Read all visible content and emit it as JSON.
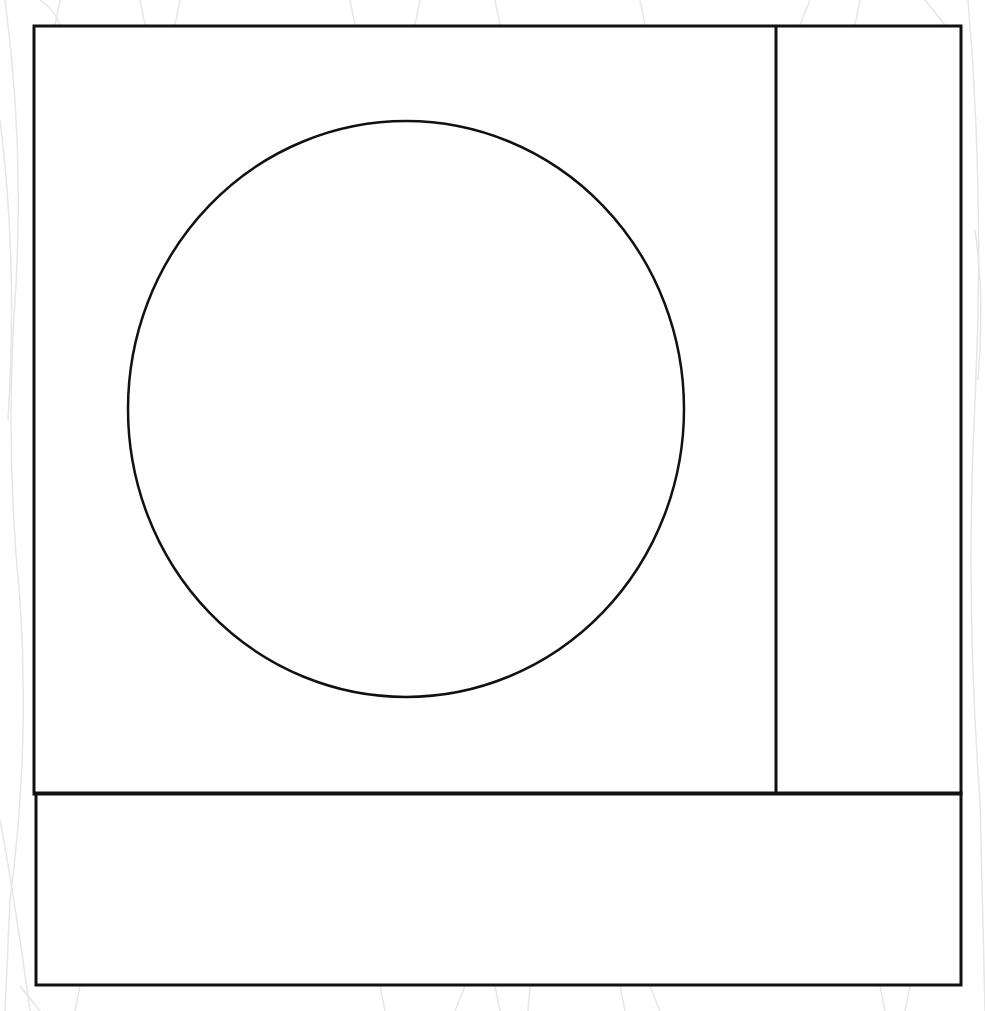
{
  "diagram": {
    "stroke_color": "#111111",
    "background_color": "#ffffff",
    "texture_color": "#e6e6e6",
    "shapes": {
      "outer_top_frame": {
        "x": 34,
        "y": 26,
        "w": 927,
        "h": 768
      },
      "right_divider": {
        "x": 776,
        "y1": 26,
        "y2": 793
      },
      "bottom_panel": {
        "x": 36,
        "y": 793,
        "w": 925,
        "h": 192
      },
      "circle": {
        "cx": 406,
        "cy": 409,
        "rx": 278,
        "ry": 288
      }
    },
    "text": []
  }
}
